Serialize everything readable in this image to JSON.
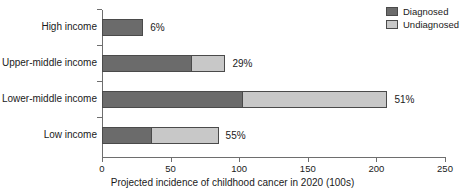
{
  "chart_data": {
    "type": "bar",
    "orientation": "horizontal",
    "stacked": true,
    "title": "",
    "xlabel": "Projected incidence of childhood cancer in 2020 (100s)",
    "ylabel": "",
    "xlim": [
      0,
      250
    ],
    "xticks": [
      0,
      50,
      100,
      150,
      200,
      250
    ],
    "xtick_labels": [
      "0",
      "50",
      "100",
      "150",
      "200",
      "250"
    ],
    "grid": false,
    "legend_position": "top-right",
    "categories": [
      "High income",
      "Upper-middle income",
      "Lower-middle income",
      "Low income"
    ],
    "series": [
      {
        "name": "Diagnosed",
        "color": "#6b6b6b",
        "values": [
          30,
          65,
          102,
          36
        ]
      },
      {
        "name": "Undiagnosed",
        "color": "#c8c8c8",
        "values": [
          0,
          25,
          106,
          49
        ]
      }
    ],
    "totals": [
      30,
      90,
      208,
      85
    ],
    "annotations": [
      "6%",
      "29%",
      "51%",
      "55%"
    ],
    "annotation_meaning": "share of total undiagnosed"
  },
  "legend": {
    "items": [
      {
        "label": "Diagnosed",
        "color": "#6b6b6b"
      },
      {
        "label": "Undiagnosed",
        "color": "#c8c8c8"
      }
    ]
  }
}
